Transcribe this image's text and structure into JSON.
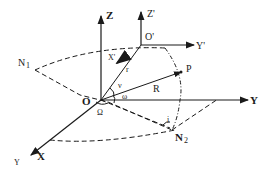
{
  "diagram": {
    "type": "orbital-elements-diagram",
    "colors": {
      "ink": "#1a1a1a",
      "background": "#ffffff"
    },
    "axes": {
      "inertial": {
        "origin": "O",
        "x": "X",
        "y": "Y",
        "z": "Z"
      },
      "body": {
        "origin": "O'",
        "x": "X'",
        "y": "Y'",
        "z": "Z'"
      }
    },
    "points": {
      "p": "P",
      "n1": "N",
      "n1_sub": "1",
      "n2": "N",
      "n2_sub": "2",
      "vernal": "Υ"
    },
    "vectors": {
      "r": "r",
      "R": "R"
    },
    "angles": {
      "nu": "ν",
      "omega": "ω",
      "Omega": "Ω",
      "i": "i"
    }
  }
}
